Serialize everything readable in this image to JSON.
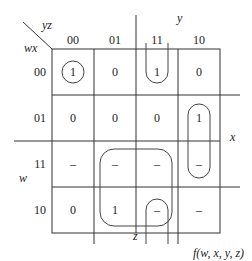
{
  "corner": {
    "col_vars": "yz",
    "row_vars": "wx"
  },
  "col_headers": [
    "00",
    "01",
    "11",
    "10"
  ],
  "row_headers": [
    "00",
    "01",
    "11",
    "10"
  ],
  "cells": [
    [
      "1",
      "0",
      "1",
      "0"
    ],
    [
      "0",
      "0",
      "0",
      "1"
    ],
    [
      "–",
      "–",
      "–",
      "–"
    ],
    [
      "0",
      "1",
      "–",
      "–"
    ]
  ],
  "variable_labels": {
    "y": "y",
    "x": "x",
    "w": "w",
    "z": "z"
  },
  "function_label": "f(w, x, y, z)"
}
